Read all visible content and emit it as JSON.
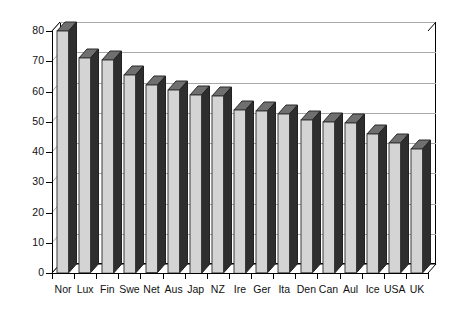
{
  "chart_data": {
    "type": "bar",
    "title": "",
    "subtitle": "",
    "xlabel": "",
    "ylabel": "",
    "categories": [
      "Nor",
      "Lux",
      "Fin",
      "Swe",
      "Net",
      "Aus",
      "Jap",
      "NZ",
      "Ire",
      "Ger",
      "Ita",
      "Den",
      "Can",
      "Aul",
      "Ice",
      "USA",
      "UK"
    ],
    "values": [
      80,
      71,
      70.5,
      65.5,
      62,
      60.5,
      59,
      58.5,
      54,
      53.5,
      52.5,
      50.5,
      50,
      49.5,
      46,
      43,
      41
    ],
    "series": [
      {
        "name": "",
        "values": [
          80,
          71,
          70.5,
          65.5,
          62,
          60.5,
          59,
          58.5,
          54,
          53.5,
          52.5,
          50.5,
          50,
          49.5,
          46,
          43,
          41
        ]
      }
    ],
    "ylim": [
      0,
      80
    ],
    "yticks": [
      0,
      10,
      20,
      30,
      40,
      50,
      60,
      70,
      80
    ],
    "ytick_labels": [
      "0",
      "10",
      "20",
      "30",
      "40",
      "50",
      "60",
      "70",
      "80"
    ],
    "grid": true,
    "grid_axis": "y",
    "legend": false,
    "legend_position": "none",
    "style": "3d-column",
    "colors": {
      "bar_face": "#d4d4d4",
      "bar_side": "#2e2e2e",
      "bar_top": "#6f6f6f",
      "gridline": "#a9a9a9",
      "axis": "#000000",
      "background": "#ffffff",
      "text": "#111111"
    }
  }
}
